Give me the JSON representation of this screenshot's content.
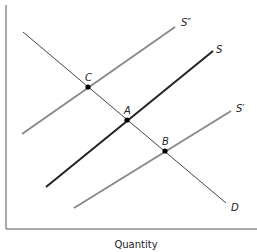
{
  "diagram": {
    "type": "supply-demand",
    "x_axis_label": "Quantity",
    "curves": [
      {
        "id": "D",
        "label": "D",
        "color": "#444444",
        "width": 1,
        "x1": 23,
        "y1": 32,
        "x2": 226,
        "y2": 203
      },
      {
        "id": "S2",
        "label": "S″",
        "color": "#8a8a8a",
        "width": 2,
        "x1": 22,
        "y1": 134,
        "x2": 175,
        "y2": 27
      },
      {
        "id": "S",
        "label": "S",
        "color": "#222222",
        "width": 2,
        "x1": 46,
        "y1": 187,
        "x2": 213,
        "y2": 51
      },
      {
        "id": "S1",
        "label": "S′",
        "color": "#8a8a8a",
        "width": 2,
        "x1": 74,
        "y1": 208,
        "x2": 231,
        "y2": 111
      }
    ],
    "points": [
      {
        "label": "C",
        "x": 88,
        "y": 87
      },
      {
        "label": "A",
        "x": 127,
        "y": 120
      },
      {
        "label": "B",
        "x": 165,
        "y": 151
      }
    ],
    "labels": {
      "D": "D",
      "S2": "S″",
      "S": "S",
      "S1": "S′",
      "C": "C",
      "A": "A",
      "B": "B"
    }
  }
}
